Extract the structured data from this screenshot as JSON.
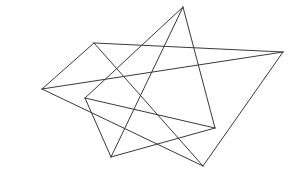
{
  "figure": {
    "width": 294,
    "height": 175,
    "background": "#ffffff",
    "stroke_color": "#3a3a3a",
    "shapes": [
      {
        "name": "quadrilateral-a",
        "vertices": [
          [
            94,
            43
          ],
          [
            283,
            52
          ],
          [
            203,
            166
          ],
          [
            42,
            89
          ]
        ],
        "edges": [
          [
            0,
            1
          ],
          [
            0,
            2
          ],
          [
            0,
            3
          ],
          [
            1,
            2
          ],
          [
            1,
            3
          ],
          [
            2,
            3
          ]
        ]
      },
      {
        "name": "quadrilateral-b",
        "vertices": [
          [
            183,
            7
          ],
          [
            215,
            128
          ],
          [
            111,
            157
          ],
          [
            85,
            98
          ]
        ],
        "edges": [
          [
            0,
            1
          ],
          [
            0,
            2
          ],
          [
            0,
            3
          ],
          [
            1,
            2
          ],
          [
            1,
            3
          ],
          [
            2,
            3
          ]
        ]
      }
    ]
  }
}
